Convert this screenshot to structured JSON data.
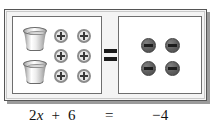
{
  "figure": {
    "kind": "cups-and-counters-balance-model",
    "equals_symbol": "=",
    "left_side": {
      "cups": [
        {
          "name": "cup",
          "value": "x"
        },
        {
          "name": "cup",
          "value": "x"
        }
      ],
      "cup_count": 2,
      "tokens": [
        {
          "sign": "+",
          "glyph": "+"
        },
        {
          "sign": "+",
          "glyph": "+"
        },
        {
          "sign": "+",
          "glyph": "+"
        },
        {
          "sign": "+",
          "glyph": "+"
        },
        {
          "sign": "+",
          "glyph": "+"
        },
        {
          "sign": "+",
          "glyph": "+"
        }
      ],
      "token_count": 6,
      "token_sign": "+"
    },
    "right_side": {
      "tokens": [
        {
          "sign": "-",
          "glyph": "−"
        },
        {
          "sign": "-",
          "glyph": "−"
        },
        {
          "sign": "-",
          "glyph": "−"
        },
        {
          "sign": "-",
          "glyph": "−"
        }
      ],
      "token_count": 4,
      "token_sign": "-"
    }
  },
  "caption": {
    "lhs_coefficient": "2",
    "lhs_variable": "x",
    "lhs_operator": "+",
    "lhs_constant": "6",
    "relation": "=",
    "rhs": "−4",
    "full_equation": "2x + 6 = −4"
  },
  "colors": {
    "token_plus_fill": "#e6e6e6",
    "token_plus_ring": "#8c8c8c",
    "token_minus_fill": "#5d5d5d",
    "panel_background": "#ffffff",
    "frame_background": "#f4f4f4",
    "frame_border": "#555555",
    "shadow": "#9b9b9b",
    "text": "#111111"
  }
}
